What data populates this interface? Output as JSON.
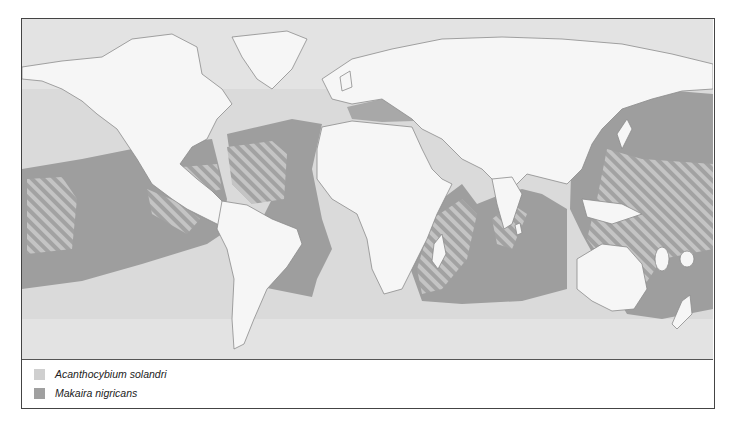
{
  "map": {
    "title": "",
    "colors": {
      "ocean": "#e3e3e3",
      "land": "#f6f6f6",
      "coastline": "#8c8c8c",
      "acanthocybium_solandri": "#d0d0d0",
      "makaira_nigricans": "#9e9e9e",
      "overlap_hatch": "#b8b8b8"
    }
  },
  "legend": {
    "items": [
      {
        "label": "Acanthocybium solandri",
        "color": "#cfcfcf"
      },
      {
        "label": "Makaira nigricans",
        "color": "#a0a0a0"
      }
    ]
  }
}
